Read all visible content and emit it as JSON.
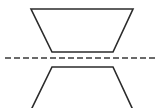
{
  "figure": {
    "type": "geometry-diagram",
    "background_color": "#ffffff",
    "stroke_color": "#2b2b2b",
    "stroke_width": 1.6,
    "canvas": {
      "width": 163,
      "height": 108
    },
    "caption_remnant": {
      "text": "cropped caption",
      "color": "#c9c9c9",
      "note": "faint partially cropped text row along the very top edge"
    },
    "mirror_line": {
      "label": "line of reflection",
      "orientation": "horizontal",
      "y": 58,
      "x_start": 5,
      "x_end": 155,
      "style": "dashed",
      "dash_length": 6,
      "gap_length": 3,
      "color": "#3a3a3a",
      "width": 1.6
    },
    "shapes": [
      {
        "name": "upper-trapezoid",
        "description": "trapezoid with long side up, sitting above the dashed line",
        "clipped": false,
        "points": [
          {
            "x": 31,
            "y": 9
          },
          {
            "x": 133,
            "y": 9
          },
          {
            "x": 113,
            "y": 52
          },
          {
            "x": 52,
            "y": 52
          }
        ]
      },
      {
        "name": "lower-trapezoid",
        "description": "mirror image below the dashed line, legs flare outward and are clipped by the bottom border",
        "clipped": true,
        "points": [
          {
            "x": 52,
            "y": 67
          },
          {
            "x": 113,
            "y": 67
          },
          {
            "x": 133,
            "y": 110
          },
          {
            "x": 31,
            "y": 110
          }
        ]
      }
    ]
  }
}
